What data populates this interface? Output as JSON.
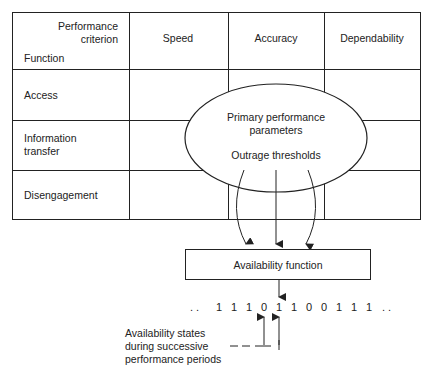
{
  "table": {
    "corner": {
      "top_line1": "Performance",
      "top_line2": "criterion",
      "bottom": "Function"
    },
    "columns": [
      "Speed",
      "Accuracy",
      "Dependability"
    ],
    "rows": [
      {
        "line1": "Access",
        "line2": ""
      },
      {
        "line1": "Information",
        "line2": "transfer"
      },
      {
        "line1": "Disengagement",
        "line2": ""
      }
    ]
  },
  "ellipse": {
    "line1": "Primary performance",
    "line2": "parameters",
    "line3": "Outrage thresholds"
  },
  "box": {
    "label": "Availability function"
  },
  "bits": {
    "text": ". .  1  1  1  0  1  1  0  0  1  1  1  . .",
    "sequence": [
      "1",
      "1",
      "1",
      "0",
      "1",
      "1",
      "0",
      "0",
      "1",
      "1",
      "1"
    ]
  },
  "annotation": {
    "line1": "Availability states",
    "line2": "during successive",
    "line3": "performance periods"
  },
  "colors": {
    "stroke": "#222222",
    "background": "#ffffff"
  }
}
